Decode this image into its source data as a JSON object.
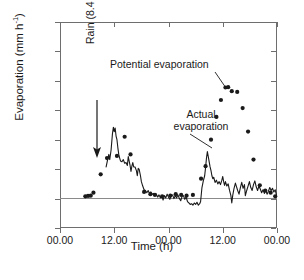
{
  "chart_data": {
    "type": "scatter",
    "title": "",
    "xlabel": "Time (h)",
    "ylabel": "Evaporation (mm h-1)",
    "ylabel_display": "Evaporation  (mm h",
    "ylabel_sup": "-1",
    "ylabel_tail": ")",
    "xlim": [
      0,
      48
    ],
    "ylim": [
      -0.2,
      1.2
    ],
    "grid": false,
    "legend_position": "inline-annotations",
    "ytick_labels": [
      "1.2",
      "1.0",
      "0.8",
      "0.6",
      "0.4",
      "0.2",
      "0",
      "-0.2"
    ],
    "ytick_values": [
      1.2,
      1.0,
      0.8,
      0.6,
      0.4,
      0.2,
      0,
      -0.2
    ],
    "xtick_labels": [
      "00.00",
      "12.00",
      "00.00",
      "12.00",
      "00.00"
    ],
    "xtick_values": [
      0,
      12,
      24,
      36,
      48
    ],
    "series": [
      {
        "name": "Potential evaporation",
        "marker": "filled-circle",
        "color": "#1a1a1a",
        "points": [
          [
            5.6,
            0.015
          ],
          [
            6.2,
            0.018
          ],
          [
            6.8,
            0.02
          ],
          [
            7.4,
            0.04
          ],
          [
            9.0,
            0.165
          ],
          [
            10.4,
            0.275
          ],
          [
            12.6,
            0.29
          ],
          [
            14.3,
            0.42
          ],
          [
            15.6,
            0.3
          ],
          [
            18.6,
            0.045
          ],
          [
            20.0,
            0.03
          ],
          [
            21.0,
            0.025
          ],
          [
            22.6,
            0.015
          ],
          [
            24.4,
            0.02
          ],
          [
            25.6,
            0.03
          ],
          [
            26.8,
            0.025
          ],
          [
            28.0,
            0.02
          ],
          [
            29.4,
            0.025
          ],
          [
            31.2,
            0.135
          ],
          [
            32.2,
            0.22
          ],
          [
            33.4,
            0.4
          ],
          [
            34.6,
            0.555
          ],
          [
            35.6,
            0.67
          ],
          [
            36.6,
            0.755
          ],
          [
            37.2,
            0.757
          ],
          [
            38.0,
            0.73
          ],
          [
            39.2,
            0.725
          ],
          [
            40.4,
            0.615
          ],
          [
            41.6,
            0.455
          ],
          [
            42.8,
            0.265
          ],
          [
            44.2,
            0.09
          ],
          [
            45.4,
            0.055
          ],
          [
            46.6,
            0.04
          ],
          [
            47.6,
            0.015
          ]
        ]
      },
      {
        "name": "Actual evaporation",
        "marker": "line",
        "color": "#1a1a1a",
        "points": [
          [
            10.2,
            0.215
          ],
          [
            10.5,
            0.26
          ],
          [
            10.8,
            0.3
          ],
          [
            11.0,
            0.265
          ],
          [
            11.3,
            0.33
          ],
          [
            11.6,
            0.44
          ],
          [
            11.8,
            0.485
          ],
          [
            12.0,
            0.455
          ],
          [
            12.2,
            0.48
          ],
          [
            12.4,
            0.425
          ],
          [
            12.6,
            0.4
          ],
          [
            12.8,
            0.345
          ],
          [
            13.0,
            0.3
          ],
          [
            13.2,
            0.275
          ],
          [
            13.4,
            0.255
          ],
          [
            13.7,
            0.25
          ],
          [
            14.0,
            0.265
          ],
          [
            14.3,
            0.24
          ],
          [
            14.6,
            0.245
          ],
          [
            14.9,
            0.225
          ],
          [
            15.1,
            0.285
          ],
          [
            15.3,
            0.255
          ],
          [
            15.5,
            0.225
          ],
          [
            15.7,
            0.185
          ],
          [
            15.9,
            0.22
          ],
          [
            16.1,
            0.245
          ],
          [
            16.3,
            0.215
          ],
          [
            16.6,
            0.215
          ],
          [
            16.9,
            0.19
          ],
          [
            17.1,
            0.155
          ],
          [
            17.3,
            0.205
          ],
          [
            17.5,
            0.2
          ],
          [
            17.8,
            0.155
          ],
          [
            18.0,
            0.115
          ],
          [
            18.3,
            0.085
          ],
          [
            18.6,
            0.06
          ],
          [
            18.9,
            0.055
          ],
          [
            19.2,
            0.04
          ],
          [
            19.5,
            0.055
          ],
          [
            19.8,
            0.035
          ],
          [
            20.1,
            0.045
          ],
          [
            20.4,
            0.03
          ],
          [
            20.7,
            0.035
          ],
          [
            21.0,
            0.02
          ],
          [
            21.3,
            0.03
          ],
          [
            21.6,
            0.01
          ],
          [
            21.9,
            0.025
          ],
          [
            22.2,
            0.005
          ],
          [
            22.5,
            0.02
          ],
          [
            22.8,
            -0.01
          ],
          [
            23.1,
            0.02
          ],
          [
            23.4,
            0.005
          ],
          [
            23.7,
            0.03
          ],
          [
            24.0,
            0.01
          ],
          [
            24.3,
            -0.005
          ],
          [
            24.6,
            0.02
          ],
          [
            24.9,
            0.025
          ],
          [
            25.2,
            0.0
          ],
          [
            25.5,
            0.02
          ],
          [
            25.8,
            0.005
          ],
          [
            26.1,
            0.025
          ],
          [
            26.4,
            0.0
          ],
          [
            26.7,
            -0.015
          ],
          [
            27.0,
            0.015
          ],
          [
            27.3,
            0.02
          ],
          [
            27.6,
            -0.005
          ],
          [
            27.9,
            0.01
          ],
          [
            28.2,
            -0.02
          ],
          [
            28.5,
            -0.03
          ],
          [
            28.8,
            -0.04
          ],
          [
            29.1,
            -0.035
          ],
          [
            29.4,
            -0.045
          ],
          [
            29.7,
            -0.03
          ],
          [
            30.0,
            -0.04
          ],
          [
            30.3,
            -0.025
          ],
          [
            30.6,
            -0.045
          ],
          [
            30.9,
            -0.035
          ],
          [
            31.1,
            -0.02
          ],
          [
            31.4,
            0.075
          ],
          [
            31.7,
            0.12
          ],
          [
            32.0,
            0.155
          ],
          [
            32.2,
            0.21
          ],
          [
            32.4,
            0.275
          ],
          [
            32.6,
            0.32
          ],
          [
            32.8,
            0.285
          ],
          [
            33.0,
            0.25
          ],
          [
            33.2,
            0.215
          ],
          [
            33.4,
            0.19
          ],
          [
            33.6,
            0.155
          ],
          [
            33.8,
            0.135
          ],
          [
            34.0,
            0.145
          ],
          [
            34.3,
            0.11
          ],
          [
            34.6,
            0.125
          ],
          [
            34.9,
            0.1
          ],
          [
            35.2,
            0.115
          ],
          [
            35.5,
            0.095
          ],
          [
            35.8,
            0.125
          ],
          [
            36.0,
            0.15
          ],
          [
            36.2,
            0.115
          ],
          [
            36.4,
            0.09
          ],
          [
            36.6,
            0.115
          ],
          [
            36.9,
            0.085
          ],
          [
            37.2,
            0.1
          ],
          [
            37.5,
            0.055
          ],
          [
            37.8,
            0.02
          ],
          [
            38.0,
            -0.03
          ],
          [
            38.2,
            0.02
          ],
          [
            38.5,
            0.07
          ],
          [
            38.8,
            0.105
          ],
          [
            39.0,
            0.085
          ],
          [
            39.3,
            0.055
          ],
          [
            39.6,
            0.03
          ],
          [
            39.9,
            0.075
          ],
          [
            40.2,
            0.11
          ],
          [
            40.5,
            0.07
          ],
          [
            40.8,
            0.095
          ],
          [
            41.0,
            0.02
          ],
          [
            41.3,
            0.055
          ],
          [
            41.6,
            0.085
          ],
          [
            41.9,
            0.115
          ],
          [
            42.2,
            0.075
          ],
          [
            42.5,
            0.055
          ],
          [
            42.8,
            0.095
          ],
          [
            43.1,
            0.12
          ],
          [
            43.4,
            0.08
          ],
          [
            43.7,
            0.055
          ],
          [
            44.0,
            0.085
          ],
          [
            44.3,
            0.065
          ],
          [
            44.6,
            0.04
          ],
          [
            44.9,
            0.06
          ],
          [
            45.2,
            0.035
          ],
          [
            45.5,
            0.055
          ],
          [
            45.8,
            0.03
          ],
          [
            46.1,
            0.05
          ],
          [
            46.4,
            0.075
          ],
          [
            46.7,
            0.055
          ],
          [
            47.0,
            0.07
          ],
          [
            47.3,
            0.045
          ],
          [
            47.6,
            0.06
          ],
          [
            47.9,
            0.02
          ]
        ]
      }
    ],
    "annotations": [
      {
        "name": "rain",
        "text": "Rain (8.4 mm)",
        "x": 8.0,
        "arrow": "down"
      },
      {
        "name": "potential-evaporation",
        "text": "Potential evaporation",
        "x": 36.0,
        "y": 0.755
      },
      {
        "name": "actual-evaporation",
        "text_line1": "Actual",
        "text_line2": "evaporation",
        "x": 32.6,
        "y": 0.32
      }
    ]
  }
}
